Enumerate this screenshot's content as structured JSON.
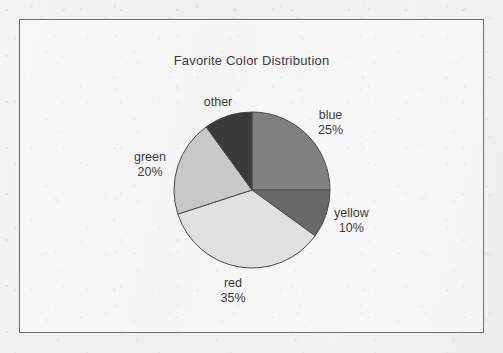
{
  "frame": {
    "border_color": "#6f6f6f",
    "background_color": "#f2f2f2"
  },
  "chart_data": {
    "type": "pie",
    "title": "Favorite Color Distribution",
    "xlabel": "",
    "ylabel": "",
    "legend_position": "none",
    "grid": false,
    "start_angle_deg": 90,
    "direction": "clockwise",
    "categories": [
      "blue",
      "yellow",
      "red",
      "green",
      "other"
    ],
    "values": [
      25,
      10,
      35,
      20,
      10
    ],
    "value_unit": "%",
    "slice_colors": [
      "#808080",
      "#686868",
      "#e0e0e0",
      "#c8c8c8",
      "#3a3a3a"
    ],
    "slice_edge_color": "#4a4a4a",
    "labels": [
      {
        "name": "blue",
        "percent": "25%",
        "show_percent": true
      },
      {
        "name": "yellow",
        "percent": "10%",
        "show_percent": true
      },
      {
        "name": "red",
        "percent": "35%",
        "show_percent": true
      },
      {
        "name": "green",
        "percent": "20%",
        "show_percent": true
      },
      {
        "name": "other",
        "percent": "",
        "show_percent": false
      }
    ]
  },
  "labels": {
    "blue": {
      "name": "blue",
      "percent": "25%"
    },
    "yellow": {
      "name": "yellow",
      "percent": "10%"
    },
    "red": {
      "name": "red",
      "percent": "35%"
    },
    "green": {
      "name": "green",
      "percent": "20%"
    },
    "other": {
      "name": "other",
      "percent": ""
    }
  }
}
